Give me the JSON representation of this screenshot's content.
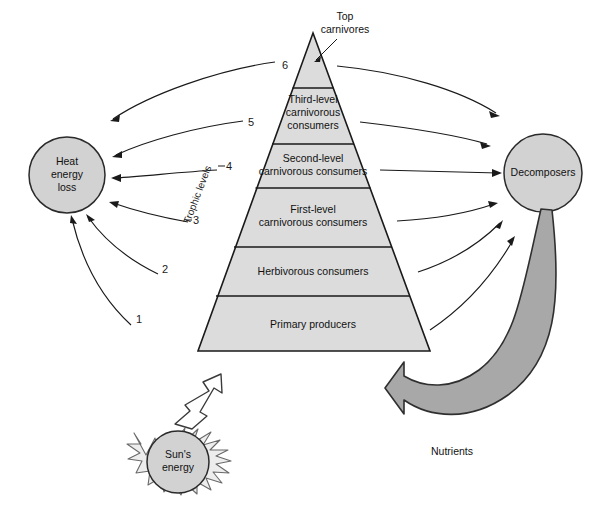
{
  "diagram": {
    "colors": {
      "pyramid_fill": "#dcdcdc",
      "circle_fill": "#d2d2d2",
      "nutrient_band": "#a8a8a8",
      "sun_rays": "#ededed",
      "outline": "#1a1a1a",
      "background": "#ffffff"
    }
  },
  "pyramid": {
    "axis_label": "Trophic levels",
    "tiers": [
      {
        "number": "6",
        "lines": [
          ""
        ],
        "name": "top-carnivores-tier"
      },
      {
        "number": "5",
        "lines": [
          "Third-level",
          "carnivorous",
          "consumers"
        ],
        "name": "third-level-carnivores-tier"
      },
      {
        "number": "4",
        "lines": [
          "Second-level",
          "carnivorous consumers"
        ],
        "name": "second-level-carnivores-tier"
      },
      {
        "number": "3",
        "lines": [
          "First-level",
          "carnivorous consumers"
        ],
        "name": "first-level-carnivores-tier"
      },
      {
        "number": "2",
        "lines": [
          "Herbivorous consumers"
        ],
        "name": "herbivorous-consumers-tier"
      },
      {
        "number": "1",
        "lines": [
          "Primary producers"
        ],
        "name": "primary-producers-tier"
      }
    ]
  },
  "callouts": {
    "top_carnivores": {
      "line1": "Top",
      "line2": "carnivores"
    },
    "nutrients": "Nutrients"
  },
  "nodes": {
    "heat_energy_loss": {
      "line1": "Heat",
      "line2": "energy",
      "line3": "loss"
    },
    "decomposers": {
      "label": "Decomposers"
    },
    "suns_energy": {
      "line1": "Sun's",
      "line2": "energy"
    }
  }
}
